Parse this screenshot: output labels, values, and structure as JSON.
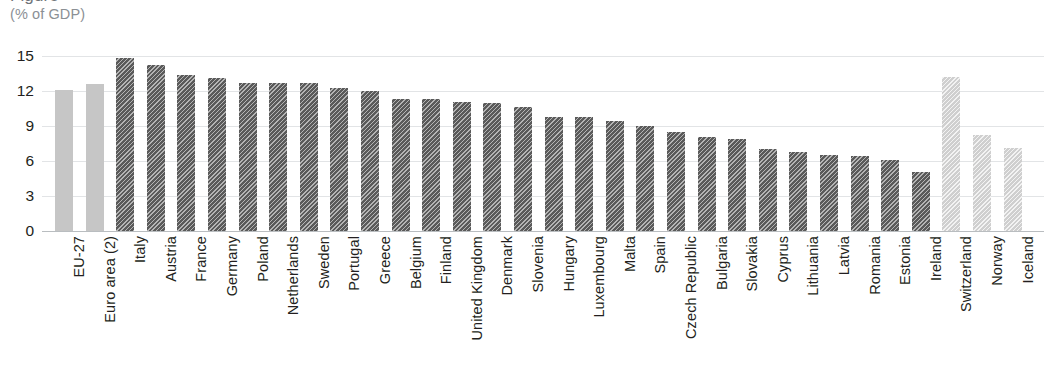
{
  "header": {
    "title_clipped": "Figure",
    "subtitle": "(% of GDP)"
  },
  "chart_data": {
    "type": "bar",
    "title": "",
    "subtitle": "(% of GDP)",
    "xlabel": "",
    "ylabel": "",
    "ylim": [
      0,
      15
    ],
    "yticks": [
      "0",
      "3",
      "6",
      "9",
      "12",
      "15"
    ],
    "ytick_values": [
      0,
      3,
      6,
      9,
      12,
      15
    ],
    "grid": true,
    "legend": "none",
    "orientation": "vertical",
    "categories": [
      "EU-27",
      "Euro area (2)",
      "Italy",
      "Austria",
      "France",
      "Germany",
      "Poland",
      "Netherlands",
      "Sweden",
      "Portugal",
      "Greece",
      "Belgium",
      "Finland",
      "United Kingdom",
      "Denmark",
      "Slovenia",
      "Hungary",
      "Luxembourg",
      "Malta",
      "Spain",
      "Czech Republic",
      "Bulgaria",
      "Slovakia",
      "Cyprus",
      "Lithuania",
      "Latvia",
      "Romania",
      "Estonia",
      "Ireland",
      "Switzerland",
      "Norway",
      "Iceland"
    ],
    "values": [
      12.1,
      12.6,
      14.8,
      14.2,
      13.4,
      13.1,
      12.7,
      12.7,
      12.7,
      12.3,
      12.0,
      11.3,
      11.3,
      11.1,
      11.0,
      10.6,
      9.8,
      9.8,
      9.4,
      9.0,
      8.5,
      8.1,
      7.9,
      7.0,
      6.8,
      6.5,
      6.4,
      6.1,
      5.1,
      13.2,
      8.2,
      7.1
    ],
    "styles": [
      "agg",
      "agg",
      "dark",
      "dark",
      "dark",
      "dark",
      "dark",
      "dark",
      "dark",
      "dark",
      "dark",
      "dark",
      "dark",
      "dark",
      "dark",
      "dark",
      "dark",
      "dark",
      "dark",
      "dark",
      "dark",
      "dark",
      "dark",
      "dark",
      "dark",
      "dark",
      "dark",
      "dark",
      "dark",
      "light",
      "light",
      "light"
    ],
    "colors": {
      "aggregate_bar": "#c6c6c6",
      "member_state_bar": "#5a5a5a",
      "non_eu_bar": "#cfcfcf",
      "gridline": "#e2e4e6",
      "axis": "#b9bdc0",
      "text": "#231f20",
      "subtitle_text": "#8b9095"
    }
  }
}
